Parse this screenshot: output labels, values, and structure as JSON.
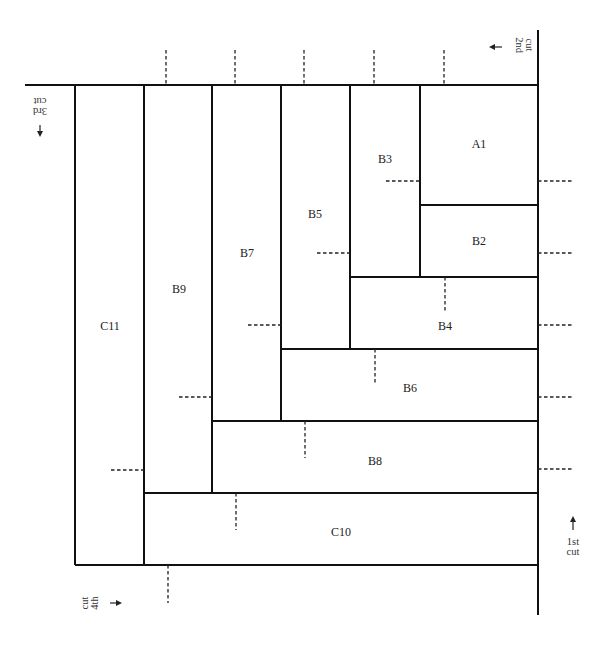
{
  "diagram": {
    "pieces": [
      {
        "id": "A1",
        "label": "A1"
      },
      {
        "id": "B2",
        "label": "B2"
      },
      {
        "id": "B3",
        "label": "B3"
      },
      {
        "id": "B4",
        "label": "B4"
      },
      {
        "id": "B5",
        "label": "B5"
      },
      {
        "id": "B6",
        "label": "B6"
      },
      {
        "id": "B7",
        "label": "B7"
      },
      {
        "id": "B8",
        "label": "B8"
      },
      {
        "id": "B9",
        "label": "B9"
      },
      {
        "id": "C10",
        "label": "C10"
      },
      {
        "id": "C11",
        "label": "C11"
      }
    ],
    "cuts": {
      "first": {
        "line1": "1st",
        "line2": "cut",
        "arrow": "arrow-up"
      },
      "second": {
        "line1": "2nd",
        "line2": "cut",
        "arrow": "arrow-left"
      },
      "third": {
        "line1": "3rd",
        "line2": "cut",
        "arrow": "arrow-down"
      },
      "fourth": {
        "line1": "4th",
        "line2": "cut",
        "arrow": "arrow-right"
      }
    }
  }
}
